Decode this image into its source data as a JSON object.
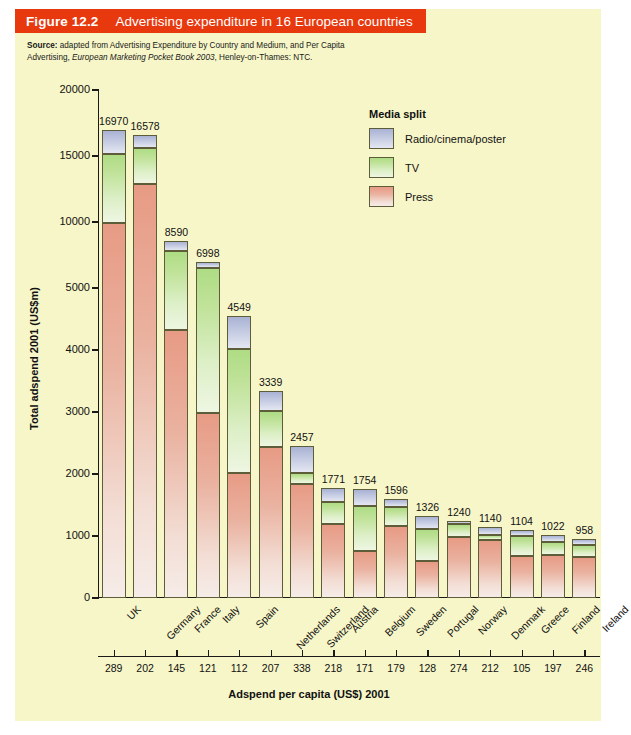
{
  "figure": {
    "number": "Figure 12.2",
    "title": "Advertising expenditure in 16 European countries",
    "banner_color": "#e8380d",
    "panel_color": "#f7f6c8",
    "source_prefix": "Source:",
    "source_line1": " adapted from Advertising Expenditure by Country and Medium, and Per Capita",
    "source_line2a": "Advertising, ",
    "source_line2b": "European Marketing Pocket Book 2003",
    "source_line2c": ", Henley-on-Thames: NTC."
  },
  "legend": {
    "title": "Media split",
    "items": [
      {
        "label": "Radio/cinema/poster",
        "color": "#b0b8d8",
        "key": "radio"
      },
      {
        "label": "TV",
        "color": "#c3e6a0",
        "key": "tv"
      },
      {
        "label": "Press",
        "color": "#eeb6a4",
        "key": "press"
      }
    ]
  },
  "chart_data": {
    "type": "bar",
    "stacked": true,
    "title": "Advertising expenditure in 16 European countries",
    "xlabel": "Adspend per capita (US$) 2001",
    "ylabel": "Total adspend 2001 (US$m)",
    "grid": false,
    "legend_position": "upper-right",
    "y_axis_note": "broken / compressed scale above 5000",
    "yticks": [
      0,
      1000,
      2000,
      3000,
      4000,
      5000,
      10000,
      15000,
      20000
    ],
    "ylim": [
      0,
      20000
    ],
    "categories": [
      "UK",
      "Germany",
      "France",
      "Italy",
      "Spain",
      "Netherlands",
      "Switzerland",
      "Austria",
      "Belgium",
      "Sweden",
      "Portugal",
      "Norway",
      "Denmark",
      "Greece",
      "Finland",
      "Ireland"
    ],
    "totals": [
      16970,
      16578,
      8590,
      6998,
      4549,
      3339,
      2457,
      1771,
      1754,
      1596,
      1326,
      1240,
      1140,
      1104,
      1022,
      958
    ],
    "per_capita": [
      289,
      202,
      145,
      121,
      112,
      207,
      338,
      218,
      171,
      179,
      128,
      274,
      212,
      105,
      197,
      246
    ],
    "series": [
      {
        "name": "Press",
        "values": [
          9900,
          12900,
          4320,
          2990,
          2010,
          2440,
          1840,
          1190,
          760,
          1160,
          600,
          980,
          930,
          670,
          690,
          660
        ]
      },
      {
        "name": "TV",
        "values": [
          5280,
          2700,
          3490,
          3510,
          2010,
          570,
          180,
          360,
          720,
          310,
          510,
          210,
          80,
          330,
          220,
          190
        ]
      },
      {
        "name": "Radio/cinema/poster",
        "values": [
          1790,
          978,
          780,
          498,
          529,
          329,
          437,
          221,
          274,
          126,
          216,
          50,
          130,
          104,
          112,
          108
        ]
      }
    ]
  }
}
